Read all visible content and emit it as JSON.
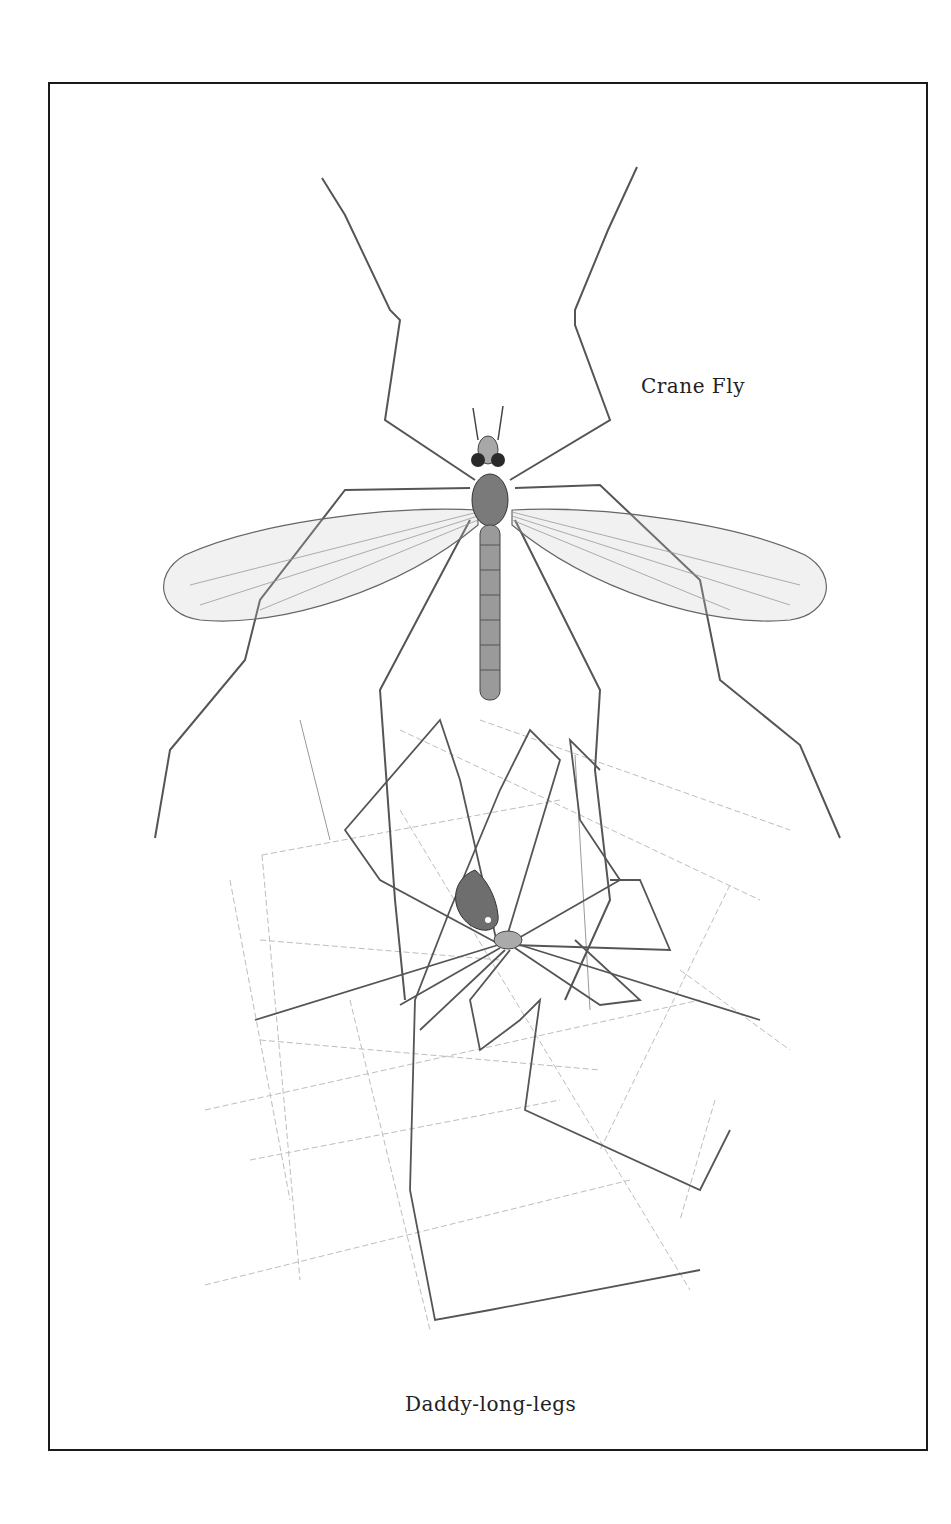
{
  "illustration": {
    "labels": {
      "crane_fly": "Crane Fly",
      "daddy_long_legs": "Daddy-long-legs"
    },
    "subjects": [
      "crane-fly",
      "daddy-long-legs-spider",
      "spider-web"
    ],
    "colors": {
      "ink": "#3a3a3a",
      "body": "#8c8c8c",
      "web": "#b8b8b8",
      "border": "#1a1a1a",
      "background": "#ffffff"
    }
  }
}
